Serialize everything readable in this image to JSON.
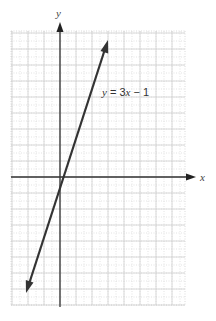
{
  "chart_data": {
    "type": "line",
    "title": "",
    "xlabel": "x",
    "ylabel": "y",
    "grid": true,
    "xlim": [
      -3,
      7.8
    ],
    "ylim": [
      -8,
      9
    ],
    "series": [
      {
        "name": "y = 3x − 1",
        "equation": "y = 3x - 1",
        "slope": 3,
        "intercept": -1,
        "x": [
          -2.1,
          3
        ],
        "y": [
          -7.3,
          8
        ]
      }
    ],
    "annotations": [
      {
        "text": "y = 3x − 1",
        "x": 2.6,
        "y": 5.1
      }
    ]
  },
  "labels": {
    "x_axis": "x",
    "y_axis": "y",
    "line_label_y": "y",
    "line_label_eq": " = 3",
    "line_label_x": "x",
    "line_label_rest": " − 1"
  }
}
